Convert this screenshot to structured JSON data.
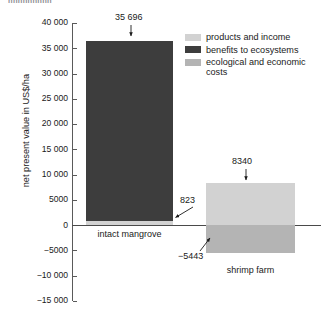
{
  "caption_fragment": "nnnnnnnnn",
  "chart_data": {
    "type": "bar",
    "title": "",
    "xlabel": "",
    "ylabel": "net present value in US$/ha",
    "ylim": [
      -15000,
      40000
    ],
    "grid": false,
    "legend_position": "top-right",
    "categories": [
      "intact mangrove",
      "shrimp farm"
    ],
    "series": [
      {
        "name": "products and income",
        "color": "#d2d2d2",
        "values": [
          823,
          8340
        ]
      },
      {
        "name": "benefits to ecosystems",
        "color": "#3d3d3d",
        "values": [
          35696,
          0
        ]
      },
      {
        "name": "ecological and economic costs",
        "color": "#b4b4b4",
        "values": [
          0,
          -5443
        ]
      }
    ],
    "tick_labels": [
      "40 000",
      "35 000",
      "30 000",
      "25 000",
      "20 000",
      "15 000",
      "10 000",
      "5000",
      "0",
      "−5000",
      "−10 000",
      "−15 000"
    ],
    "tick_values": [
      40000,
      35000,
      30000,
      25000,
      20000,
      15000,
      10000,
      5000,
      0,
      -5000,
      -10000,
      -15000
    ],
    "annotations": [
      {
        "text": "35 696",
        "value": 35696,
        "target": "intact mangrove top"
      },
      {
        "text": "823",
        "value": 823,
        "target": "intact mangrove products and income"
      },
      {
        "text": "8340",
        "value": 8340,
        "target": "shrimp farm top"
      },
      {
        "text": "−5443",
        "value": -5443,
        "target": "shrimp farm costs bottom"
      }
    ]
  },
  "legend": {
    "items": [
      {
        "label": "products and income",
        "color": "#d2d2d2"
      },
      {
        "label": "benefits to ecosystems",
        "color": "#3d3d3d"
      },
      {
        "label": "ecological and economic costs",
        "color": "#b4b4b4"
      }
    ]
  }
}
